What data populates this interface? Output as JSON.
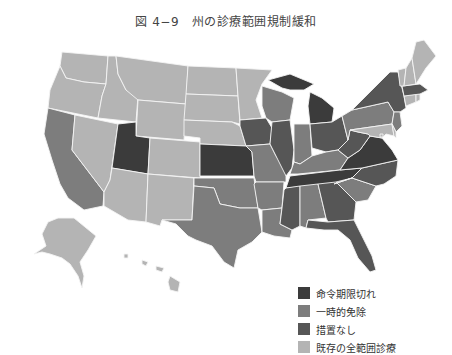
{
  "title": "図 4−9　州の診療範囲規制緩和",
  "colors": {
    "expired": "#3b3b3b",
    "temporary": "#7d7d7d",
    "none": "#565656",
    "existing": "#b4b4b4"
  },
  "legend": [
    {
      "key": "expired",
      "label": "命令期限切れ",
      "color": "#3b3b3b"
    },
    {
      "key": "temporary",
      "label": "一時的免除",
      "color": "#7d7d7d"
    },
    {
      "key": "none",
      "label": "措置なし",
      "color": "#565656"
    },
    {
      "key": "existing",
      "label": "既存の全範囲診療",
      "color": "#b4b4b4"
    }
  ],
  "states": {
    "WA": "existing",
    "OR": "existing",
    "ID": "existing",
    "MT": "existing",
    "WY": "existing",
    "ND": "existing",
    "SD": "existing",
    "NE": "existing",
    "MN": "existing",
    "CO": "existing",
    "NV": "existing",
    "AZ": "existing",
    "NM": "existing",
    "AK": "existing",
    "HI": "existing",
    "ME": "existing",
    "NH": "existing",
    "VT": "existing",
    "RI": "existing",
    "CT": "existing",
    "MD": "existing",
    "DC": "existing",
    "DE": "existing",
    "UT": "expired",
    "KS": "expired",
    "MI": "expired",
    "VA": "expired",
    "TN": "expired",
    "IA": "none",
    "IL": "none",
    "OH": "none",
    "MS": "none",
    "GA": "none",
    "FL": "none",
    "NY": "none",
    "MA": "none",
    "WV": "none",
    "NC": "none",
    "CA": "temporary",
    "TX": "temporary",
    "OK": "temporary",
    "MO": "temporary",
    "AR": "temporary",
    "LA": "temporary",
    "WI": "temporary",
    "IN": "temporary",
    "KY": "temporary",
    "AL": "temporary",
    "SC": "temporary",
    "PA": "temporary",
    "NJ": "temporary"
  }
}
